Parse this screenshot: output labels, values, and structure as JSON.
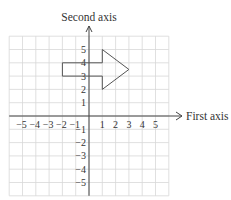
{
  "diagram": {
    "y_axis_label": "Second axis",
    "x_axis_label": "First axis",
    "x_ticks": [
      {
        "value": -5,
        "label": "−5"
      },
      {
        "value": -4,
        "label": "−4"
      },
      {
        "value": -3,
        "label": "−3"
      },
      {
        "value": -2,
        "label": "−2"
      },
      {
        "value": -1,
        "label": "−1"
      },
      {
        "value": 1,
        "label": "1"
      },
      {
        "value": 2,
        "label": "2"
      },
      {
        "value": 3,
        "label": "3"
      },
      {
        "value": 4,
        "label": "4"
      },
      {
        "value": 5,
        "label": "5"
      }
    ],
    "y_ticks": [
      {
        "value": 5,
        "label": "5"
      },
      {
        "value": 4,
        "label": "4"
      },
      {
        "value": 3,
        "label": "3"
      },
      {
        "value": 2,
        "label": "2"
      },
      {
        "value": 1,
        "label": "1"
      },
      {
        "value": -1,
        "label": "−1"
      },
      {
        "value": -2,
        "label": "−2"
      },
      {
        "value": -3,
        "label": "−3"
      },
      {
        "value": -4,
        "label": "−4"
      },
      {
        "value": -5,
        "label": "−5"
      }
    ],
    "grid": {
      "xmin": -6,
      "xmax": 6,
      "ymin": -6,
      "ymax": 6
    },
    "shape": {
      "name": "arrow",
      "points": [
        [
          -2,
          4
        ],
        [
          1,
          4
        ],
        [
          1,
          5
        ],
        [
          3,
          3.5
        ],
        [
          1,
          2
        ],
        [
          1,
          3
        ],
        [
          -2,
          3
        ]
      ]
    },
    "colors": {
      "grid": "#d8d8d8",
      "axis": "#444444",
      "shape": "#555555",
      "text": "#333333"
    }
  }
}
